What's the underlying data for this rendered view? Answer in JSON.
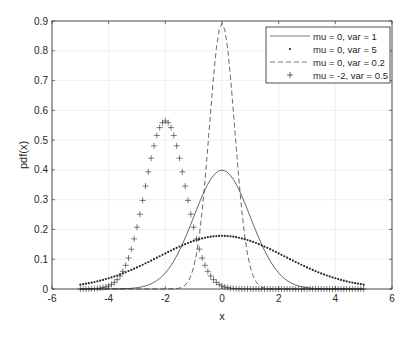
{
  "chart_data": {
    "type": "line",
    "title": "",
    "xlabel": "x",
    "ylabel": "pdf(x)",
    "xlim": [
      -6,
      6
    ],
    "ylim": [
      0,
      0.9
    ],
    "xticks": [
      -6,
      -4,
      -2,
      0,
      2,
      4,
      6
    ],
    "yticks": [
      0,
      0.1,
      0.2,
      0.3,
      0.4,
      0.5,
      0.6,
      0.7,
      0.8,
      0.9
    ],
    "xtick_labels": [
      "-6",
      "-4",
      "-2",
      "0",
      "2",
      "4",
      "6"
    ],
    "ytick_labels": [
      "0",
      "0.1",
      "0.2",
      "0.3",
      "0.4",
      "0.5",
      "0.6",
      "0.7",
      "0.8",
      "0.9"
    ],
    "grid": true,
    "legend_position": "northeast",
    "x_range": [
      -5,
      5
    ],
    "x_step": 0.1,
    "series": [
      {
        "name": "mu = 0, var = 1",
        "mu": 0,
        "var": 1,
        "style": "solid",
        "marker": "none",
        "peak": 0.399
      },
      {
        "name": "mu = 0, var = 5",
        "mu": 0,
        "var": 5,
        "style": "none",
        "marker": "dot",
        "peak": 0.178
      },
      {
        "name": "mu = 0, var = 0.2",
        "mu": 0,
        "var": 0.2,
        "style": "dashed",
        "marker": "none",
        "peak": 0.892
      },
      {
        "name": "mu = -2, var = 0.5",
        "mu": -2,
        "var": 0.5,
        "style": "none",
        "marker": "plus",
        "peak": 0.564
      }
    ]
  },
  "legend": {
    "items": [
      {
        "label": "mu = 0, var = 1"
      },
      {
        "label": "mu = 0, var = 5"
      },
      {
        "label": "mu = 0, var = 0.2"
      },
      {
        "label": "mu = -2, var = 0.5"
      }
    ]
  },
  "axes": {
    "xlabel": "x",
    "ylabel": "pdf(x)"
  }
}
